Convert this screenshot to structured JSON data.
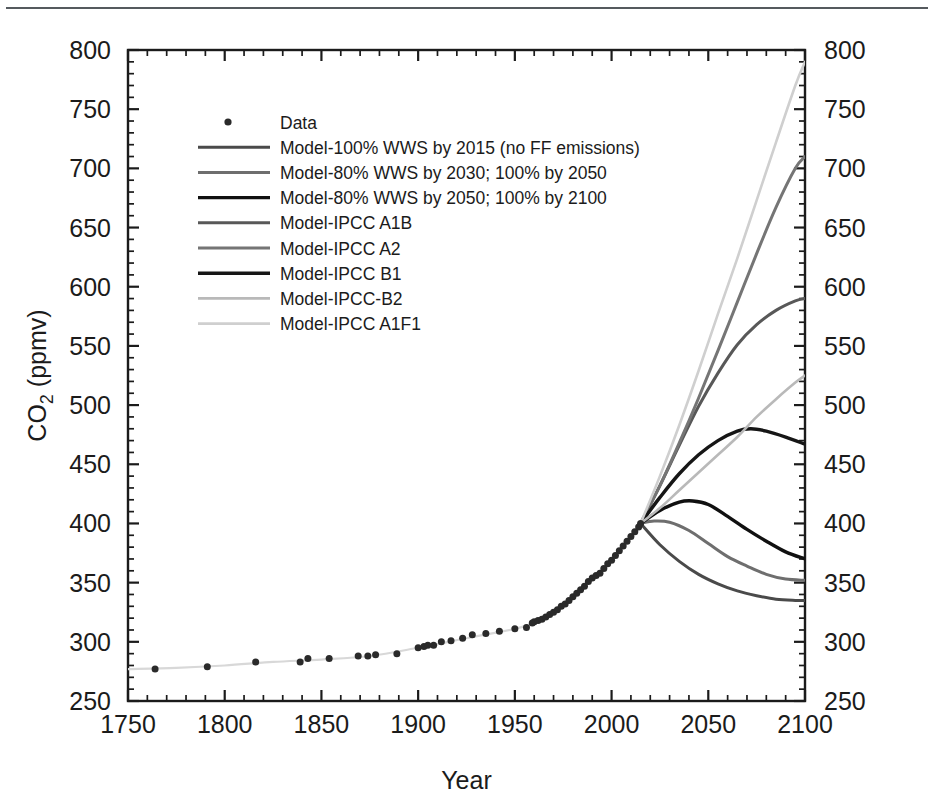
{
  "figure": {
    "top_rule_color": "#555a5e",
    "background": "#ffffff"
  },
  "axes": {
    "x": {
      "label": "Year",
      "min": 1750,
      "max": 2100,
      "major_ticks": [
        1750,
        1800,
        1850,
        1900,
        1950,
        2000,
        2050,
        2100
      ],
      "tick_labels": [
        "1750",
        "1800",
        "1850",
        "1900",
        "1950",
        "2000",
        "2050",
        "2100"
      ],
      "minor_tick_step": 10
    },
    "y": {
      "label_main": "CO",
      "label_sub": "2",
      "label_tail": " (ppmv)",
      "label_full": "CO2 (ppmv)",
      "min": 250,
      "max": 800,
      "major_ticks": [
        250,
        300,
        350,
        400,
        450,
        500,
        550,
        600,
        650,
        700,
        750,
        800
      ],
      "tick_labels": [
        "250",
        "300",
        "350",
        "400",
        "450",
        "500",
        "550",
        "600",
        "650",
        "700",
        "750",
        "800"
      ],
      "minor_tick_step": 10,
      "mirrored_right_axis": true
    }
  },
  "legend": {
    "entries": [
      {
        "label": "Data",
        "marker": "dot",
        "color": "#2a2a2a",
        "width": 0
      },
      {
        "label": "Model-100% WWS by 2015 (no FF emissions)",
        "marker": "line",
        "color": "#4a4a4a",
        "width": 3.0
      },
      {
        "label": "Model-80% WWS by 2030; 100% by 2050",
        "marker": "line",
        "color": "#6e6e6e",
        "width": 3.0
      },
      {
        "label": "Model-80% WWS by 2050; 100% by 2100",
        "marker": "line",
        "color": "#101010",
        "width": 3.4
      },
      {
        "label": "Model-IPCC A1B",
        "marker": "line",
        "color": "#585858",
        "width": 3.0
      },
      {
        "label": "Model-IPCC A2",
        "marker": "line",
        "color": "#757575",
        "width": 3.0
      },
      {
        "label": "Model-IPCC B1",
        "marker": "line",
        "color": "#161616",
        "width": 3.4
      },
      {
        "label": "Model-IPCC-B2",
        "marker": "line",
        "color": "#b9b9b9",
        "width": 2.6
      },
      {
        "label": "Model-IPCC A1F1",
        "marker": "line",
        "color": "#cfcfcf",
        "width": 2.6
      }
    ]
  },
  "chart_data": {
    "type": "line",
    "title": "",
    "xlabel": "Year",
    "ylabel": "CO2 (ppmv)",
    "xlim": [
      1750,
      2100
    ],
    "ylim": [
      250,
      800
    ],
    "grid": false,
    "legend_position": "upper-left-inside",
    "historical_fit": {
      "name": "Historical CO2 fit",
      "color": "#d8d8d8",
      "x": [
        1750,
        1775,
        1800,
        1825,
        1850,
        1875,
        1900,
        1925,
        1950,
        1960,
        1970,
        1980,
        1990,
        2000,
        2010,
        2015
      ],
      "y": [
        277,
        278,
        280,
        283,
        285,
        288,
        295,
        303,
        311,
        316,
        325,
        338,
        354,
        369,
        389,
        400
      ]
    },
    "scatter": {
      "name": "Data",
      "color": "#2a2a2a",
      "marker_size": 7,
      "points": [
        [
          1764,
          277
        ],
        [
          1791,
          279
        ],
        [
          1816,
          283
        ],
        [
          1839,
          283
        ],
        [
          1843,
          286
        ],
        [
          1854,
          286
        ],
        [
          1869,
          288
        ],
        [
          1874,
          288
        ],
        [
          1878,
          289
        ],
        [
          1889,
          290
        ],
        [
          1900,
          295
        ],
        [
          1903,
          296
        ],
        [
          1905,
          297
        ],
        [
          1908,
          297
        ],
        [
          1912,
          300
        ],
        [
          1917,
          301
        ],
        [
          1923,
          303
        ],
        [
          1928,
          306
        ],
        [
          1935,
          307
        ],
        [
          1942,
          309
        ],
        [
          1950,
          311
        ],
        [
          1956,
          312
        ],
        [
          1959,
          316
        ],
        [
          1960,
          317
        ],
        [
          1962,
          318
        ],
        [
          1964,
          319
        ],
        [
          1966,
          321
        ],
        [
          1968,
          323
        ],
        [
          1970,
          325
        ],
        [
          1972,
          327
        ],
        [
          1974,
          330
        ],
        [
          1976,
          332
        ],
        [
          1978,
          335
        ],
        [
          1980,
          338
        ],
        [
          1982,
          341
        ],
        [
          1984,
          344
        ],
        [
          1986,
          347
        ],
        [
          1988,
          351
        ],
        [
          1990,
          354
        ],
        [
          1992,
          356
        ],
        [
          1994,
          358
        ],
        [
          1996,
          362
        ],
        [
          1998,
          366
        ],
        [
          2000,
          369
        ],
        [
          2002,
          373
        ],
        [
          2004,
          377
        ],
        [
          2006,
          381
        ],
        [
          2008,
          385
        ],
        [
          2010,
          389
        ],
        [
          2012,
          393
        ],
        [
          2014,
          397
        ],
        [
          2015,
          400
        ]
      ]
    },
    "divergence": {
      "year": 2015,
      "value": 400
    },
    "series": [
      {
        "name": "Model-100% WWS by 2015 (no FF emissions)",
        "color": "#4a4a4a",
        "width": 3.0,
        "x": [
          2015,
          2025,
          2035,
          2045,
          2055,
          2065,
          2075,
          2085,
          2095,
          2100
        ],
        "y": [
          400,
          382,
          368,
          357,
          349,
          343,
          339,
          336,
          335,
          335
        ]
      },
      {
        "name": "Model-80% WWS by 2030; 100% by 2050",
        "color": "#6e6e6e",
        "width": 3.0,
        "x": [
          2015,
          2022,
          2030,
          2040,
          2050,
          2060,
          2070,
          2080,
          2090,
          2100
        ],
        "y": [
          400,
          402,
          401,
          394,
          383,
          372,
          364,
          357,
          353,
          352
        ]
      },
      {
        "name": "Model-80% WWS by 2050; 100% by 2100",
        "color": "#101010",
        "width": 3.4,
        "x": [
          2015,
          2025,
          2035,
          2042,
          2050,
          2060,
          2070,
          2080,
          2090,
          2100
        ],
        "y": [
          400,
          411,
          418,
          419,
          416,
          406,
          395,
          385,
          376,
          370
        ]
      },
      {
        "name": "Model-IPCC A1B",
        "color": "#585858",
        "width": 3.0,
        "x": [
          2015,
          2025,
          2035,
          2045,
          2055,
          2065,
          2075,
          2085,
          2095,
          2100
        ],
        "y": [
          400,
          432,
          466,
          499,
          527,
          551,
          568,
          580,
          588,
          590
        ]
      },
      {
        "name": "Model-IPCC A2",
        "color": "#757575",
        "width": 3.0,
        "x": [
          2015,
          2025,
          2035,
          2045,
          2055,
          2065,
          2075,
          2085,
          2095,
          2100
        ],
        "y": [
          400,
          432,
          468,
          506,
          546,
          587,
          628,
          667,
          700,
          710
        ]
      },
      {
        "name": "Model-IPCC B1",
        "color": "#161616",
        "width": 3.4,
        "x": [
          2015,
          2025,
          2035,
          2045,
          2055,
          2065,
          2072,
          2080,
          2090,
          2100
        ],
        "y": [
          400,
          422,
          442,
          458,
          470,
          478,
          480,
          478,
          473,
          467
        ]
      },
      {
        "name": "Model-IPCC-B2",
        "color": "#b9b9b9",
        "width": 2.6,
        "x": [
          2015,
          2025,
          2035,
          2045,
          2055,
          2065,
          2075,
          2085,
          2095,
          2100
        ],
        "y": [
          400,
          413,
          428,
          443,
          458,
          473,
          490,
          505,
          519,
          525
        ]
      },
      {
        "name": "Model-IPCC A1F1",
        "color": "#cfcfcf",
        "width": 2.6,
        "x": [
          2015,
          2025,
          2035,
          2045,
          2055,
          2065,
          2075,
          2085,
          2095,
          2100
        ],
        "y": [
          400,
          440,
          483,
          529,
          577,
          624,
          673,
          722,
          770,
          790
        ]
      }
    ]
  }
}
